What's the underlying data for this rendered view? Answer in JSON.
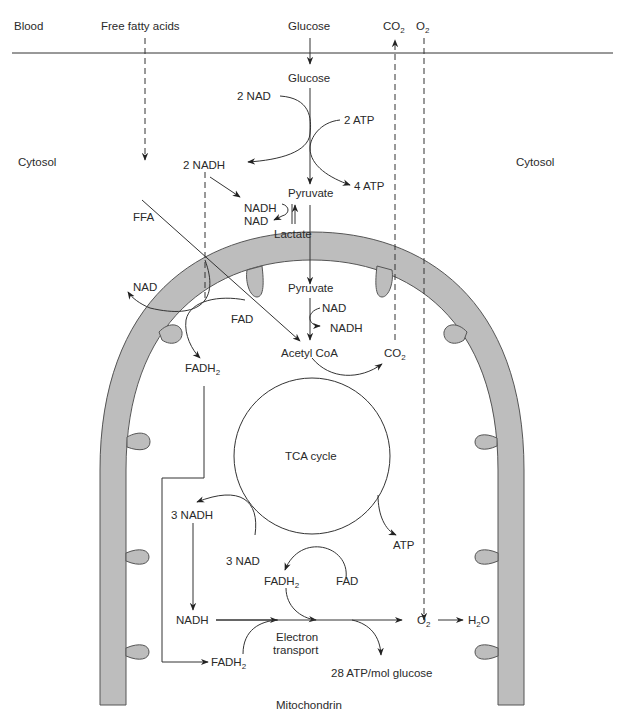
{
  "diagram": {
    "regions": {
      "blood": "Blood",
      "cytosol_left": "Cytosol",
      "cytosol_right": "Cytosol",
      "mitochondrion": "Mitochondrin"
    },
    "blood_inputs": {
      "free_fatty_acids": "Free fatty acids",
      "glucose": "Glucose",
      "co2": {
        "base": "CO",
        "sub": "2"
      },
      "o2": {
        "base": "O",
        "sub": "2"
      }
    },
    "glycolysis": {
      "glucose": "Glucose",
      "nad_in": "2 NAD",
      "atp_in": "2 ATP",
      "nadh_out": "2 NADH",
      "atp_out": "4 ATP",
      "pyruvate": "Pyruvate",
      "lactate_nadh": "NADH",
      "lactate_nad": "NAD",
      "lactate": "Lactate"
    },
    "fatty_acid": {
      "ffa": "FFA",
      "nad": "NAD",
      "fad": "FAD",
      "fadh2": {
        "base": "FADH",
        "sub": "2"
      }
    },
    "mitochondrial": {
      "pyruvate": "Pyruvate",
      "nad": "NAD",
      "nadh": "NADH",
      "acetyl_coa": "Acetyl CoA",
      "co2": {
        "base": "CO",
        "sub": "2"
      },
      "tca_cycle": "TCA cycle",
      "nadh3": "3 NADH",
      "nad3": "3 NAD",
      "atp": "ATP",
      "fadh2": {
        "base": "FADH",
        "sub": "2"
      },
      "fad": "FAD",
      "electron": "Electron",
      "transport": "transport",
      "o2": {
        "base": "O",
        "sub": "2"
      },
      "h2o": {
        "pre": "H",
        "sub": "2",
        "post": "O"
      },
      "fadh2_bottom": {
        "base": "FADH",
        "sub": "2"
      },
      "atp_yield": "28 ATP/mol glucose"
    },
    "colors": {
      "membrane_fill": "#bdbdbd",
      "membrane_stroke": "#555555",
      "line": "#333333",
      "text": "#2a2a2a",
      "background": "#ffffff"
    }
  }
}
